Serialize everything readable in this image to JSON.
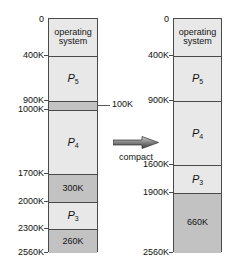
{
  "figure": {
    "total_memory": "2560K",
    "colors": {
      "process_fill": "#e8e8e8",
      "hole_fill": "#c2c2c2",
      "border": "#4a4a4a",
      "text": "#111111",
      "background": "#ffffff"
    }
  },
  "before": {
    "name": "before-compaction",
    "addresses": [
      "0",
      "400K",
      "900K",
      "1000K",
      "1700K",
      "2000K",
      "2300K",
      "2560K"
    ],
    "blocks": [
      {
        "label": "operating\nsystem",
        "kind": "os",
        "start": 0,
        "end": 400
      },
      {
        "label": "P",
        "sub": "5",
        "kind": "process",
        "start": 400,
        "end": 900
      },
      {
        "label": "",
        "kind": "hole",
        "start": 900,
        "end": 1000
      },
      {
        "label": "P",
        "sub": "4",
        "kind": "process",
        "start": 1000,
        "end": 1700
      },
      {
        "label": "300K",
        "kind": "hole",
        "start": 1700,
        "end": 2000
      },
      {
        "label": "P",
        "sub": "3",
        "kind": "process",
        "start": 2000,
        "end": 2300
      },
      {
        "label": "260K",
        "kind": "hole",
        "start": 2300,
        "end": 2560
      }
    ],
    "callout": "100K"
  },
  "after": {
    "name": "after-compaction",
    "addresses": [
      "0",
      "400K",
      "900K",
      "1600K",
      "1900K",
      "2560K"
    ],
    "blocks": [
      {
        "label": "operating\nsystem",
        "kind": "os",
        "start": 0,
        "end": 400
      },
      {
        "label": "P",
        "sub": "5",
        "kind": "process",
        "start": 400,
        "end": 900
      },
      {
        "label": "P",
        "sub": "4",
        "kind": "process",
        "start": 900,
        "end": 1600
      },
      {
        "label": "P",
        "sub": "3",
        "kind": "process",
        "start": 1600,
        "end": 1900
      },
      {
        "label": "660K",
        "kind": "hole",
        "start": 1900,
        "end": 2560
      }
    ]
  },
  "transition": {
    "caption": "compact",
    "icon": "right-arrow-icon"
  }
}
